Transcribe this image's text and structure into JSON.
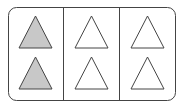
{
  "diagram": {
    "columns": 3,
    "rows": 2,
    "total_shapes": 6,
    "shaded_shapes": 2,
    "colors": {
      "stroke": "#444444",
      "shaded_fill": "#c8c8c8",
      "unshaded_fill": "#ffffff",
      "frame": "#444444"
    },
    "cells": [
      {
        "column": 1,
        "row": 1,
        "shape": "triangle",
        "shaded": true
      },
      {
        "column": 1,
        "row": 2,
        "shape": "triangle",
        "shaded": true
      },
      {
        "column": 2,
        "row": 1,
        "shape": "triangle",
        "shaded": false
      },
      {
        "column": 2,
        "row": 2,
        "shape": "triangle",
        "shaded": false
      },
      {
        "column": 3,
        "row": 1,
        "shape": "triangle",
        "shaded": false
      },
      {
        "column": 3,
        "row": 2,
        "shape": "triangle",
        "shaded": false
      }
    ]
  }
}
